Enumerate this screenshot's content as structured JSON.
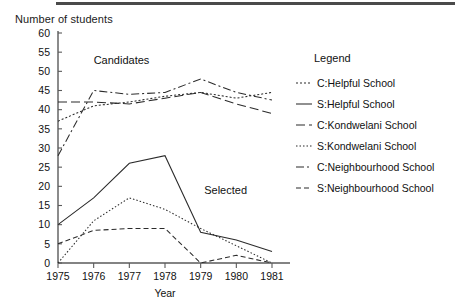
{
  "chart_data": {
    "type": "line",
    "title": "Number of students",
    "xlabel": "Year",
    "ylabel": "",
    "x": [
      1975,
      1976,
      1977,
      1978,
      1979,
      1980,
      1981
    ],
    "categories": [
      "1975",
      "1976",
      "1977",
      "1978",
      "1979",
      "1980",
      "1981"
    ],
    "xlim": [
      1975,
      1981
    ],
    "ylim": [
      0,
      60
    ],
    "yticks": [
      0,
      5,
      10,
      15,
      20,
      25,
      30,
      35,
      40,
      45,
      50,
      55,
      60
    ],
    "ytick_labels": [
      "0",
      "5",
      "10",
      "15",
      "20",
      "25",
      "30",
      "35",
      "40",
      "45",
      "50",
      "55",
      "60"
    ],
    "grid": false,
    "legend_position": "right",
    "legend_title": "Legend",
    "annotations": [
      {
        "text": "Candidates",
        "x": 1976.0,
        "y": 52
      },
      {
        "text": "Selected",
        "x": 1979.1,
        "y": 18
      }
    ],
    "series": [
      {
        "name": "C:Helpful School",
        "style": "dotted",
        "dasharray": "2,2",
        "values": [
          37,
          41,
          42,
          43.5,
          44.5,
          43,
          44.5
        ]
      },
      {
        "name": "S:Helpful School",
        "style": "solid",
        "dasharray": "none",
        "values": [
          10,
          17,
          26,
          28,
          8,
          6,
          3
        ]
      },
      {
        "name": "C:Kondwelani School",
        "style": "long-dash",
        "dasharray": "9,4",
        "values": [
          42,
          42,
          41.5,
          43,
          44.5,
          41.5,
          39
        ]
      },
      {
        "name": "S:Kondwelani School",
        "style": "fine-dotted",
        "dasharray": "1.5,2",
        "values": [
          0,
          11,
          17,
          14,
          9,
          4.5,
          0
        ]
      },
      {
        "name": "C:Neighbourhood School",
        "style": "dash-dot",
        "dasharray": "8,3,2,3",
        "values": [
          28,
          45,
          44,
          44.5,
          48,
          44.5,
          42.5
        ]
      },
      {
        "name": "S:Neighbourhood School",
        "style": "dashed",
        "dasharray": "5,3",
        "values": [
          5,
          8.5,
          9,
          9,
          0,
          2,
          0
        ]
      }
    ]
  },
  "legend": {
    "title": "Legend",
    "items": [
      {
        "label": "C:Helpful School",
        "dasharray": "2,2"
      },
      {
        "label": "S:Helpful School",
        "dasharray": "none"
      },
      {
        "label": "C:Kondwelani School",
        "dasharray": "9,4"
      },
      {
        "label": "S:Kondwelani School",
        "dasharray": "1.5,2"
      },
      {
        "label": "C:Neighbourhood School",
        "dasharray": "8,3,2,3"
      },
      {
        "label": "S:Neighbourhood School",
        "dasharray": "5,3"
      }
    ]
  },
  "colors": {
    "line": "#2b2b2b",
    "axis": "#5a5a5a",
    "text": "#111111",
    "background": "#ffffff"
  }
}
